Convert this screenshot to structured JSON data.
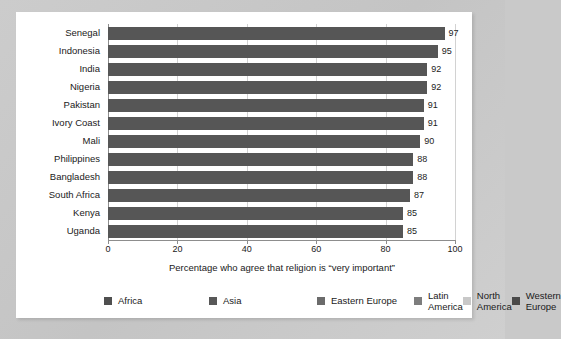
{
  "chart_data": {
    "type": "bar",
    "orientation": "horizontal",
    "title": "",
    "xlabel": "Percentage who agree that religion is “very important”",
    "ylabel": "",
    "xlim": [
      0,
      100
    ],
    "xticks": [
      "0",
      "20",
      "40",
      "60",
      "80",
      "100"
    ],
    "grid": true,
    "categories": [
      "Senegal",
      "Indonesia",
      "India",
      "Nigeria",
      "Pakistan",
      "Ivory Coast",
      "Mali",
      "Philippines",
      "Bangladesh",
      "South Africa",
      "Kenya",
      "Uganda"
    ],
    "values": [
      97,
      95,
      92,
      92,
      91,
      91,
      90,
      88,
      88,
      87,
      85,
      85
    ],
    "bar_color": "#565656",
    "legend_position": "bottom",
    "legend": [
      {
        "label": "Africa",
        "color": "#4f4f4f"
      },
      {
        "label": "Asia",
        "color": "#585858"
      },
      {
        "label": "Eastern Europe",
        "color": "#6b6b6b"
      },
      {
        "label": "Latin America",
        "color": "#7d7d7d"
      },
      {
        "label": "North America",
        "color": "#c8c8c8"
      },
      {
        "label": "Western Europe",
        "color": "#4a4a4a"
      }
    ]
  }
}
